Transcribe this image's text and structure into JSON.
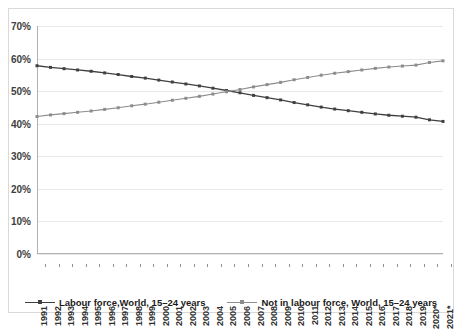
{
  "chart_data": {
    "type": "line",
    "title": "",
    "xlabel": "",
    "ylabel": "",
    "ylim": [
      0,
      70
    ],
    "ytick_labels": [
      "70%",
      "60%",
      "50%",
      "40%",
      "30%",
      "20%",
      "10%",
      "0%"
    ],
    "ytick_values": [
      70,
      60,
      50,
      40,
      30,
      20,
      10,
      0
    ],
    "grid": true,
    "legend_position": "bottom",
    "categories": [
      "1991",
      "1992",
      "1993",
      "1994",
      "1995",
      "1996",
      "1997",
      "1998",
      "1999",
      "2000",
      "2001",
      "2002",
      "2003",
      "2004",
      "2005",
      "2006",
      "2007",
      "2008",
      "2009",
      "2010",
      "2011",
      "2012",
      "2013",
      "2014",
      "2015",
      "2016",
      "2017",
      "2018",
      "2019",
      "2020*",
      "2021*"
    ],
    "series": [
      {
        "name": "Labour force,World, 15–24 years",
        "color": "#404040",
        "marker": "square",
        "values": [
          57.8,
          57.3,
          56.9,
          56.5,
          56.1,
          55.6,
          55.1,
          54.5,
          54.0,
          53.4,
          52.8,
          52.2,
          51.6,
          50.9,
          50.2,
          49.5,
          48.7,
          48.0,
          47.3,
          46.5,
          45.8,
          45.1,
          44.5,
          44.0,
          43.5,
          43.0,
          42.6,
          42.3,
          42.0,
          41.2,
          40.7
        ]
      },
      {
        "name": "Not in labour force, World, 15–24 years",
        "color": "#8c8c8c",
        "marker": "square",
        "values": [
          42.2,
          42.7,
          43.1,
          43.5,
          43.9,
          44.4,
          44.9,
          45.5,
          46.0,
          46.6,
          47.2,
          47.8,
          48.4,
          49.1,
          49.8,
          50.5,
          51.3,
          52.0,
          52.7,
          53.5,
          54.2,
          54.9,
          55.5,
          56.0,
          56.5,
          57.0,
          57.4,
          57.7,
          58.0,
          58.8,
          59.3
        ]
      }
    ]
  },
  "legend": {
    "items": [
      {
        "label": "Labour force,World, 15–24 years",
        "color": "#404040"
      },
      {
        "label": "Not in labour force, World, 15–24 years",
        "color": "#8c8c8c"
      }
    ]
  }
}
